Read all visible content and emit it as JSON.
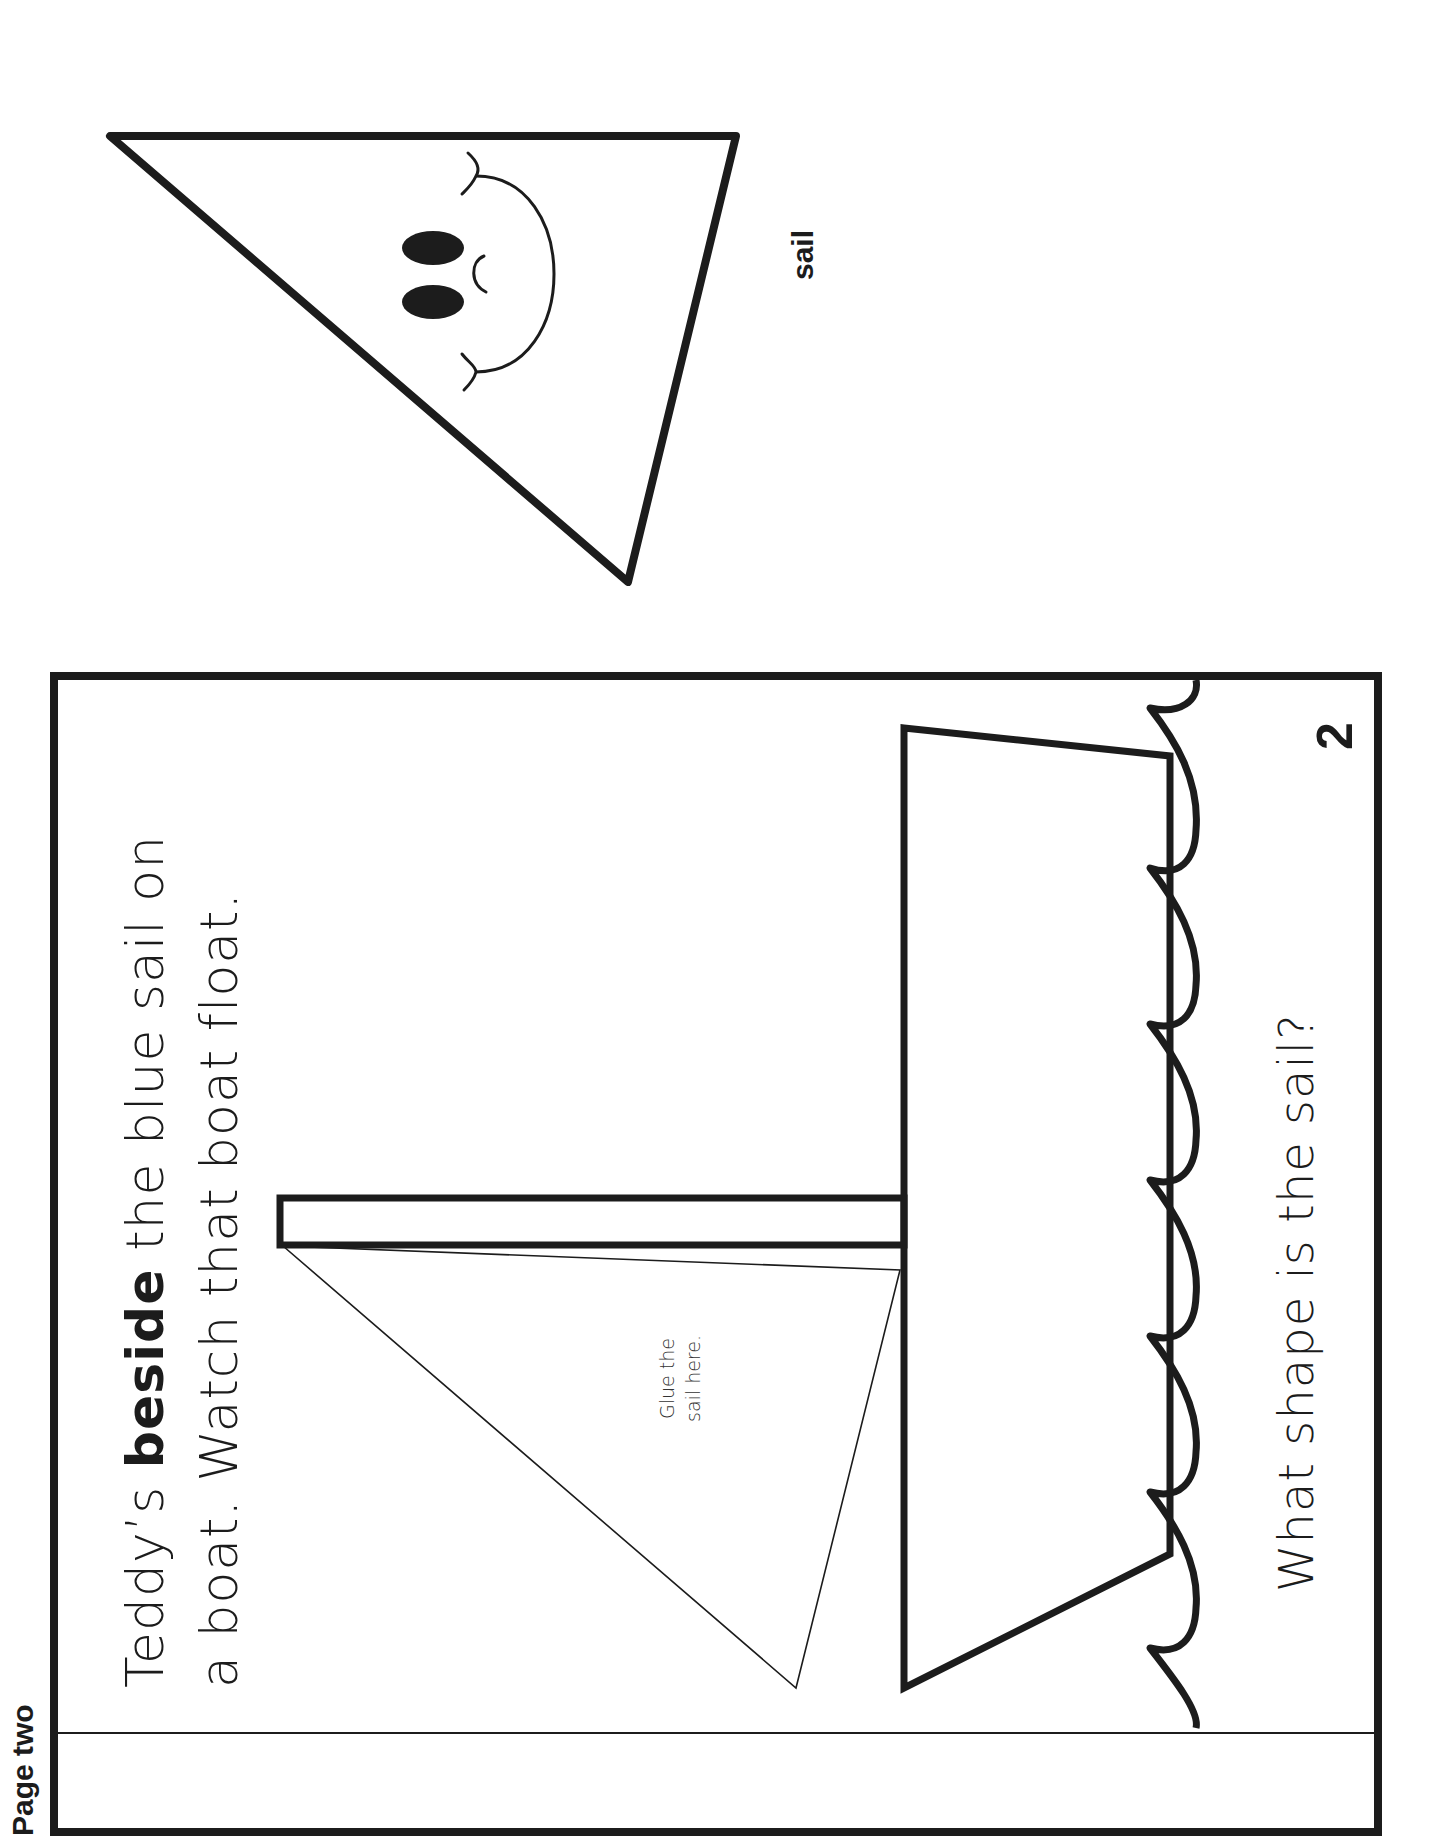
{
  "page": {
    "label": "Page two",
    "number": "2"
  },
  "story": {
    "line1_prefix": "Teddy’s ",
    "line1_bold": "beside",
    "line1_suffix": " the blue sail on",
    "line2": "a boat.  Watch that boat float."
  },
  "glue_hint": {
    "line1": "Glue the",
    "line2": "sail here."
  },
  "question": "What shape is the sail?",
  "cutout": {
    "label": "sail",
    "shape": "triangle-with-smiling-face"
  },
  "colors": {
    "ink": "#1c1c1c",
    "paper": "#ffffff"
  }
}
